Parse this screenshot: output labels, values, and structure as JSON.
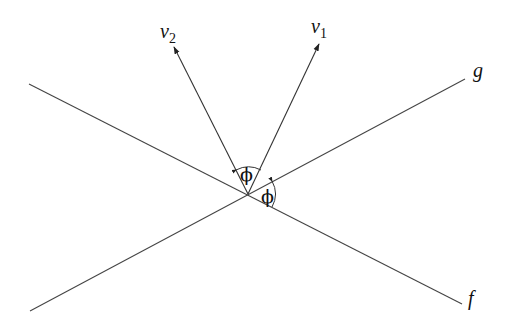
{
  "diagram": {
    "labels": {
      "v1": "v",
      "v1_sub": "1",
      "v2": "v",
      "v2_sub": "2",
      "g": "g",
      "f": "f",
      "phi_upper": "ϕ",
      "phi_lower": "ϕ"
    },
    "colors": {
      "stroke": "#333333",
      "text": "#111111"
    }
  }
}
